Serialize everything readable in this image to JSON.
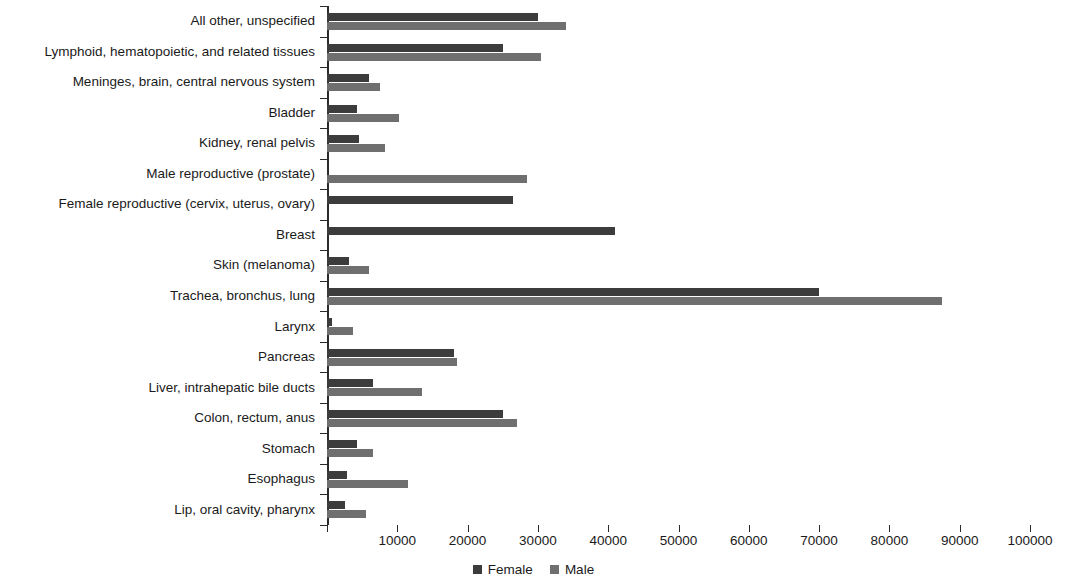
{
  "chart_data": {
    "type": "bar",
    "orientation": "horizontal",
    "title": "",
    "subtitle": "",
    "xlabel": "",
    "ylabel": "",
    "xlim": [
      0,
      100000
    ],
    "xticks": [
      0,
      10000,
      20000,
      30000,
      40000,
      50000,
      60000,
      70000,
      80000,
      90000,
      100000
    ],
    "xtick_labels": [
      "",
      "10000",
      "20000",
      "30000",
      "40000",
      "50000",
      "60000",
      "70000",
      "80000",
      "90000",
      "100000"
    ],
    "grid": false,
    "legend_position": "bottom-center",
    "categories": [
      "All other, unspecified",
      "Lymphoid, hematopoietic, and related tissues",
      "Meninges, brain, central nervous system",
      "Bladder",
      "Kidney, renal pelvis",
      "Male reproductive (prostate)",
      "Female reproductive (cervix, uterus, ovary)",
      "Breast",
      "Skin (melanoma)",
      "Trachea, bronchus, lung",
      "Larynx",
      "Pancreas",
      "Liver, intrahepatic bile ducts",
      "Colon, rectum, anus",
      "Stomach",
      "Esophagus",
      "Lip, oral cavity, pharynx"
    ],
    "series": [
      {
        "name": "Female",
        "color": "#3c3c3c",
        "values": [
          30000,
          25000,
          6000,
          4200,
          4500,
          0,
          26500,
          41000,
          3200,
          70000,
          700,
          18000,
          6500,
          25000,
          4300,
          2800,
          2500
        ]
      },
      {
        "name": "Male",
        "color": "#6f6f6f",
        "values": [
          34000,
          30500,
          7500,
          10200,
          8200,
          28500,
          0,
          0,
          6000,
          87500,
          3700,
          18500,
          13500,
          27000,
          6500,
          11500,
          5500
        ]
      }
    ]
  },
  "legend": {
    "items": [
      {
        "label": "Female",
        "color": "#3c3c3c"
      },
      {
        "label": "Male",
        "color": "#6f6f6f"
      }
    ]
  }
}
